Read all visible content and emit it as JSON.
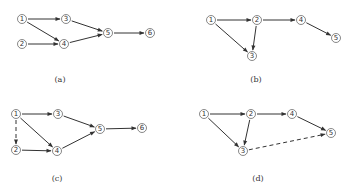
{
  "figure": {
    "panels": [
      {
        "id": "a",
        "caption": "(a)",
        "caption_pos": [
          60,
          82
        ],
        "nodes": [
          {
            "id": "1",
            "label": "1",
            "x": 22,
            "y": 19
          },
          {
            "id": "2",
            "label": "2",
            "x": 22,
            "y": 44
          },
          {
            "id": "3",
            "label": "3",
            "x": 66,
            "y": 19
          },
          {
            "id": "4",
            "label": "4",
            "x": 64,
            "y": 44
          },
          {
            "id": "5",
            "label": "5",
            "x": 108,
            "y": 33
          },
          {
            "id": "6",
            "label": "6",
            "x": 150,
            "y": 33
          }
        ],
        "edges": [
          {
            "from": "1",
            "to": "3",
            "style": "solid"
          },
          {
            "from": "1",
            "to": "4",
            "style": "solid"
          },
          {
            "from": "2",
            "to": "4",
            "style": "solid"
          },
          {
            "from": "3",
            "to": "5",
            "style": "solid"
          },
          {
            "from": "4",
            "to": "5",
            "style": "solid"
          },
          {
            "from": "5",
            "to": "6",
            "style": "solid"
          }
        ]
      },
      {
        "id": "b",
        "caption": "(b)",
        "caption_pos": [
          256,
          82
        ],
        "nodes": [
          {
            "id": "1",
            "label": "1",
            "x": 211,
            "y": 20
          },
          {
            "id": "2",
            "label": "2",
            "x": 257,
            "y": 20
          },
          {
            "id": "3",
            "label": "3",
            "x": 252,
            "y": 56
          },
          {
            "id": "4",
            "label": "4",
            "x": 301,
            "y": 20
          },
          {
            "id": "5",
            "label": "5",
            "x": 336,
            "y": 38
          }
        ],
        "edges": [
          {
            "from": "1",
            "to": "2",
            "style": "solid"
          },
          {
            "from": "1",
            "to": "3",
            "style": "solid"
          },
          {
            "from": "2",
            "to": "3",
            "style": "solid"
          },
          {
            "from": "2",
            "to": "4",
            "style": "solid"
          },
          {
            "from": "4",
            "to": "5",
            "style": "solid"
          }
        ]
      },
      {
        "id": "c",
        "caption": "(c)",
        "caption_pos": [
          57,
          181
        ],
        "nodes": [
          {
            "id": "1",
            "label": "1",
            "x": 16,
            "y": 114
          },
          {
            "id": "2",
            "label": "2",
            "x": 16,
            "y": 150
          },
          {
            "id": "3",
            "label": "3",
            "x": 58,
            "y": 114
          },
          {
            "id": "4",
            "label": "4",
            "x": 57,
            "y": 151
          },
          {
            "id": "5",
            "label": "5",
            "x": 100,
            "y": 129
          },
          {
            "id": "6",
            "label": "6",
            "x": 142,
            "y": 128
          }
        ],
        "edges": [
          {
            "from": "1",
            "to": "3",
            "style": "solid"
          },
          {
            "from": "1",
            "to": "4",
            "style": "solid"
          },
          {
            "from": "1",
            "to": "2",
            "style": "dashed"
          },
          {
            "from": "2",
            "to": "4",
            "style": "solid"
          },
          {
            "from": "3",
            "to": "5",
            "style": "solid"
          },
          {
            "from": "4",
            "to": "5",
            "style": "solid"
          },
          {
            "from": "5",
            "to": "6",
            "style": "solid"
          }
        ]
      },
      {
        "id": "d",
        "caption": "(d)",
        "caption_pos": [
          258,
          181
        ],
        "nodes": [
          {
            "id": "1",
            "label": "1",
            "x": 204,
            "y": 114
          },
          {
            "id": "2",
            "label": "2",
            "x": 251,
            "y": 114
          },
          {
            "id": "3",
            "label": "3",
            "x": 243,
            "y": 151
          },
          {
            "id": "4",
            "label": "4",
            "x": 292,
            "y": 114
          },
          {
            "id": "5",
            "label": "5",
            "x": 331,
            "y": 133
          }
        ],
        "edges": [
          {
            "from": "1",
            "to": "2",
            "style": "solid"
          },
          {
            "from": "1",
            "to": "3",
            "style": "solid"
          },
          {
            "from": "2",
            "to": "3",
            "style": "solid"
          },
          {
            "from": "2",
            "to": "4",
            "style": "solid"
          },
          {
            "from": "4",
            "to": "5",
            "style": "solid"
          },
          {
            "from": "3",
            "to": "5",
            "style": "dashed"
          }
        ]
      }
    ],
    "colors": {
      "line": "#333333",
      "node_stroke": "#555555",
      "background": "#ffffff"
    }
  }
}
